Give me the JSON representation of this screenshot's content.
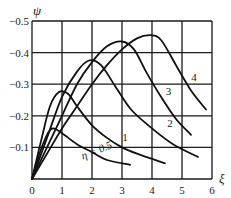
{
  "chart_data": {
    "type": "line",
    "title": "",
    "xlabel": "ξ",
    "ylabel": "ψ",
    "xlim": [
      0,
      6
    ],
    "ylim": [
      0,
      -0.5
    ],
    "grid": true,
    "legend": "inline curve labels",
    "x_ticks": [
      "0",
      "1",
      "2",
      "3",
      "4",
      "5",
      "6"
    ],
    "y_ticks": [
      "-0.1",
      "-0.2",
      "-0.3",
      "-0.4",
      "-0.5"
    ],
    "series": [
      {
        "name": "η = 0.5",
        "label": "η = 0.5",
        "points": [
          [
            0,
            0
          ],
          [
            0.25,
            -0.08
          ],
          [
            0.5,
            -0.14
          ],
          [
            0.7,
            -0.16
          ],
          [
            1.0,
            -0.145
          ],
          [
            1.5,
            -0.11
          ],
          [
            2.0,
            -0.085
          ],
          [
            2.5,
            -0.06
          ],
          [
            3.27,
            -0.045
          ]
        ]
      },
      {
        "name": "1",
        "label": "1",
        "points": [
          [
            0,
            0
          ],
          [
            0.3,
            -0.12
          ],
          [
            0.6,
            -0.23
          ],
          [
            0.9,
            -0.275
          ],
          [
            1.2,
            -0.27
          ],
          [
            1.5,
            -0.23
          ],
          [
            2.0,
            -0.17
          ],
          [
            2.5,
            -0.13
          ],
          [
            3.0,
            -0.1
          ],
          [
            3.5,
            -0.08
          ],
          [
            4.43,
            -0.05
          ]
        ]
      },
      {
        "name": "2",
        "label": "2",
        "points": [
          [
            0,
            0
          ],
          [
            0.5,
            -0.13
          ],
          [
            1.0,
            -0.26
          ],
          [
            1.5,
            -0.34
          ],
          [
            1.9,
            -0.375
          ],
          [
            2.3,
            -0.36
          ],
          [
            2.8,
            -0.29
          ],
          [
            3.3,
            -0.22
          ],
          [
            4.0,
            -0.16
          ],
          [
            4.7,
            -0.11
          ],
          [
            5.53,
            -0.07
          ]
        ]
      },
      {
        "name": "3",
        "label": "3",
        "points": [
          [
            0,
            0
          ],
          [
            0.5,
            -0.1
          ],
          [
            1.0,
            -0.2
          ],
          [
            1.5,
            -0.3
          ],
          [
            2.0,
            -0.37
          ],
          [
            2.5,
            -0.42
          ],
          [
            3.0,
            -0.435
          ],
          [
            3.4,
            -0.41
          ],
          [
            3.8,
            -0.34
          ],
          [
            4.3,
            -0.26
          ],
          [
            4.8,
            -0.19
          ],
          [
            5.3,
            -0.14
          ]
        ]
      },
      {
        "name": "4",
        "label": "4",
        "points": [
          [
            0,
            0
          ],
          [
            0.5,
            -0.08
          ],
          [
            1.0,
            -0.16
          ],
          [
            1.5,
            -0.23
          ],
          [
            2.0,
            -0.3
          ],
          [
            2.5,
            -0.36
          ],
          [
            3.0,
            -0.41
          ],
          [
            3.5,
            -0.445
          ],
          [
            3.95,
            -0.455
          ],
          [
            4.3,
            -0.44
          ],
          [
            4.8,
            -0.36
          ],
          [
            5.3,
            -0.28
          ],
          [
            5.8,
            -0.22
          ]
        ]
      }
    ],
    "label_positions": {
      "η = 0.5": [
        2.2,
        -0.08
      ],
      "1": [
        3.1,
        -0.12
      ],
      "2": [
        4.6,
        -0.165
      ],
      "3": [
        4.55,
        -0.265
      ],
      "4": [
        5.4,
        -0.31
      ]
    }
  }
}
